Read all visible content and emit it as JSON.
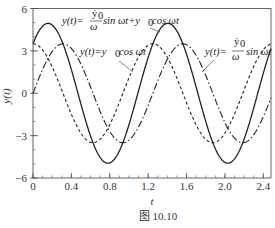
{
  "chart_data": {
    "type": "line",
    "title": "",
    "caption": "图 10.10",
    "xlabel": "t",
    "ylabel": "y(t)",
    "xlim": [
      0,
      2.48
    ],
    "ylim": [
      -6,
      6
    ],
    "grid": false,
    "x_ticks": [
      0,
      0.4,
      0.8,
      1.2,
      1.6,
      2.0,
      2.4
    ],
    "x_tick_labels": [
      "0",
      "0.4",
      "0.8",
      "1.2",
      "1.6",
      "2.0",
      "2.4"
    ],
    "x_minor_step": 0.1,
    "y_ticks": [
      -6,
      -3,
      0,
      3,
      6
    ],
    "y_tick_labels": [
      "−6",
      "−3",
      "0",
      "3",
      "6"
    ],
    "y_minor_step": 1,
    "params": {
      "y0": 3.5,
      "v0_over_omega": 3.5,
      "omega": 5.03
    },
    "series": [
      {
        "name": "y(t) = (ẏ0/ω) sin ωt + y0 cos ωt",
        "style": "solid",
        "formula": "A*sin(w*t) + B*cos(w*t)",
        "x": [
          0,
          0.156,
          0.4,
          0.78,
          1.0,
          1.4,
          1.8,
          2.03,
          2.4
        ],
        "values": [
          3.5,
          4.95,
          2.9,
          -4.95,
          -2.0,
          4.9,
          1.4,
          -4.95,
          -0.5
        ]
      },
      {
        "name": "y(t) = y0 cos ωt",
        "style": "dashed",
        "formula": "B*cos(w*t)",
        "x": [
          0,
          0.31,
          0.625,
          0.94,
          1.25,
          1.56,
          1.87,
          2.19,
          2.48
        ],
        "values": [
          3.5,
          0,
          -3.5,
          0,
          3.5,
          0,
          -3.5,
          0,
          3.5
        ]
      },
      {
        "name": "y(t) = (ẏ0/ω) sin ωt",
        "style": "dash-dot",
        "formula": "A*sin(w*t)",
        "x": [
          0,
          0.31,
          0.625,
          0.94,
          1.25,
          1.56,
          1.87,
          2.19,
          2.48
        ],
        "values": [
          0,
          3.5,
          0,
          -3.5,
          0,
          3.5,
          0,
          -3.5,
          0
        ]
      }
    ],
    "annotations": [
      {
        "id": "combined",
        "text_prefix": "y(t)=",
        "frac_num": "ẏ",
        "frac_num_sub": "0",
        "frac_den": "ω",
        "text_suffix": "sin ωt+y",
        "suffix_sub": "0",
        "text_tail": "cos ωt"
      },
      {
        "id": "cos",
        "text_prefix": "y(t)=y",
        "sub": "0",
        "text_tail": "cos ωt"
      },
      {
        "id": "sin",
        "text_prefix": "y(t)=",
        "frac_num": "ẏ",
        "frac_num_sub": "0",
        "frac_den": "ω",
        "text_tail": "sin ωt"
      }
    ]
  }
}
